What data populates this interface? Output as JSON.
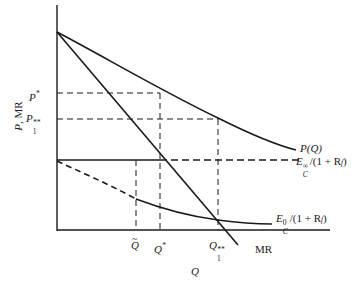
{
  "diagram": {
    "axes": {
      "y_label_P": "P",
      "y_label_rest": ", MR",
      "x_label": "Q"
    },
    "y_ticks": {
      "p_star": {
        "base": "P",
        "sup": "*"
      },
      "p1_double_star": {
        "base": "P",
        "sub": "1",
        "sup": "**"
      }
    },
    "x_ticks": {
      "q_tilde": {
        "base": "Q",
        "accent": "~"
      },
      "q_star": {
        "base": "Q",
        "sup": "*"
      },
      "q1_double_star": {
        "base": "Q",
        "sub": "1",
        "sup": "**"
      }
    },
    "curves": {
      "demand": {
        "label": "P(Q)",
        "style": "solid"
      },
      "marginal_revenue": {
        "label": "MR",
        "style": "solid"
      },
      "ec_infinity": {
        "label_E": "E",
        "label_sup": "∞",
        "label_sub": "C",
        "label_tail": "/(1 + R",
        "label_tail_sub": "f",
        "label_close": ")",
        "style": "solid-then-dashed"
      },
      "ec_zero": {
        "label_E": "E",
        "label_sup": "0",
        "label_sub": "C",
        "label_tail": "/(1 + R",
        "label_tail_sub": "f",
        "label_close": ")",
        "style": "dashed-then-solid"
      }
    },
    "colors": {
      "ink": "#1a1a1a",
      "background": "#ffffff"
    }
  }
}
